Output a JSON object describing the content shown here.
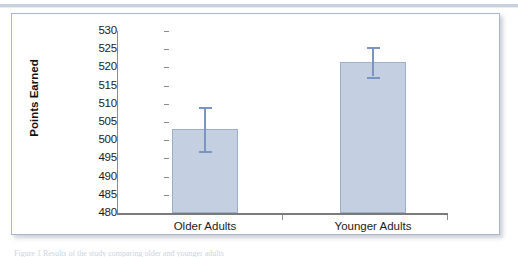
{
  "figure": {
    "caption_sliver": "Figure 1 Results of the study comparing older and younger adults"
  },
  "chart_data": {
    "type": "bar",
    "title": "",
    "xlabel": "",
    "ylabel": "Points Earned",
    "categories": [
      "Older Adults",
      "Younger Adults"
    ],
    "values": [
      503,
      521.5
    ],
    "errors_low": [
      497,
      517.5
    ],
    "errors_high": [
      509,
      525.5
    ],
    "ylim": [
      480,
      530
    ],
    "ytick_step": 5,
    "yticks": [
      530,
      525,
      520,
      515,
      510,
      505,
      500,
      495,
      490,
      485,
      480
    ],
    "ytick_labels": [
      "530",
      "525",
      "520",
      "515",
      "510",
      "505",
      "500",
      "495",
      "490",
      "485",
      "480"
    ],
    "grid": false,
    "legend": null,
    "colors": {
      "bar_fill": "#c4d0e1",
      "bar_border": "#9db0cb",
      "error_bar": "#7a96c0",
      "axis": "#8b8b8b",
      "frame": "#aab6cb",
      "text": "#1b1b1b"
    }
  }
}
